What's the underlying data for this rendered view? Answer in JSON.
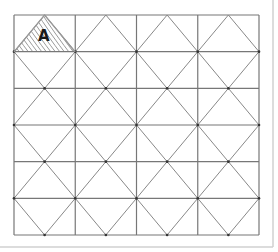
{
  "diagram": {
    "type": "triangle-tessellation-grid",
    "grid": {
      "columns": 4,
      "rows": 6,
      "x0": 14,
      "y0": 15,
      "x1": 259,
      "y1": 235,
      "line_color": "#777777",
      "diagonal_color": "#888888"
    },
    "frame": {
      "right_x": 273,
      "bottom_y": 247,
      "color": "#d0d0d0"
    },
    "highlighted_triangle": {
      "label": "A",
      "cell_column": 1,
      "cell_row": 1,
      "vertices": [
        [
          14,
          52
        ],
        [
          44.6,
          15
        ],
        [
          75.25,
          52
        ]
      ],
      "hatch_color": "#9a9a9a",
      "label_x": 38,
      "label_y": 29
    }
  }
}
